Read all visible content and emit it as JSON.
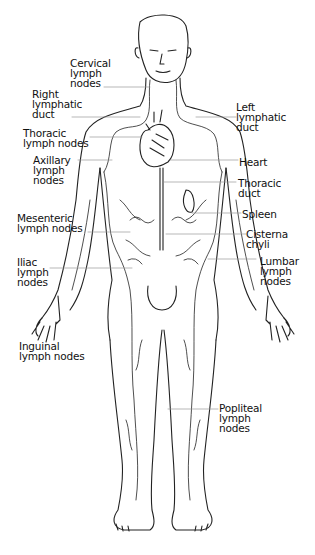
{
  "labels": {
    "cervical": "Cervical\nlymph\nnodes",
    "right_duct": "Right\nlymphatic\nduct",
    "thoracic_nodes": "Thoracic\nlymph nodes",
    "axillary": "Axillary\nlymph\nnodes",
    "mesenteric": "Mesenteric\nlymph nodes",
    "iliac": "Iliac\nlymph\nnodes",
    "inguinal": "Inguinal\nlymph nodes",
    "left_duct": "Left\nlymphatic\nduct",
    "heart": "Heart",
    "thoracic_duct": "Thoracic\nduct",
    "spleen": "Spleen",
    "cisterna": "Cisterna\nchyli",
    "lumbar": "Lumbar\nlymph\nnodes",
    "popliteal": "Popliteal\nlymph\nnodes"
  }
}
